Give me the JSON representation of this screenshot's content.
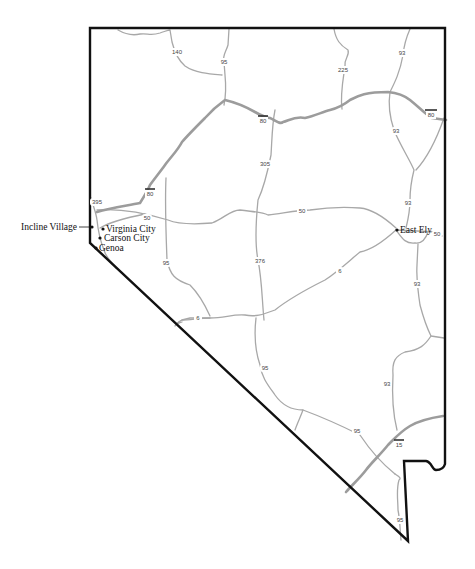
{
  "map": {
    "region": "Nevada",
    "cities": [
      {
        "id": "incline-village",
        "name": "Incline Village",
        "label_side": "left"
      },
      {
        "id": "virginia-city",
        "name": "Virginia City",
        "label_side": "right"
      },
      {
        "id": "carson-city",
        "name": "Carson City",
        "label_side": "right"
      },
      {
        "id": "genoa",
        "name": "Genoa",
        "label_side": "right"
      },
      {
        "id": "east-ely",
        "name": "East Ely",
        "label_side": "right"
      }
    ],
    "route_shields": [
      {
        "id": "140",
        "label": "140",
        "type": "state"
      },
      {
        "id": "95-north",
        "label": "95",
        "type": "us"
      },
      {
        "id": "225",
        "label": "225",
        "type": "state"
      },
      {
        "id": "93-north",
        "label": "93",
        "type": "us"
      },
      {
        "id": "80-central",
        "label": "80",
        "type": "interstate"
      },
      {
        "id": "80-east",
        "label": "80",
        "type": "interstate"
      },
      {
        "id": "80-west",
        "label": "80",
        "type": "interstate"
      },
      {
        "id": "93-wells",
        "label": "93",
        "type": "us"
      },
      {
        "id": "305",
        "label": "305",
        "type": "state"
      },
      {
        "id": "395",
        "label": "395",
        "type": "us"
      },
      {
        "id": "50-west",
        "label": "50",
        "type": "us"
      },
      {
        "id": "50-central",
        "label": "50",
        "type": "us"
      },
      {
        "id": "93-ely-north",
        "label": "93",
        "type": "us"
      },
      {
        "id": "50-east",
        "label": "50",
        "type": "us"
      },
      {
        "id": "95-fallon",
        "label": "95",
        "type": "us"
      },
      {
        "id": "376",
        "label": "376",
        "type": "state"
      },
      {
        "id": "6-east",
        "label": "6",
        "type": "us"
      },
      {
        "id": "6-west",
        "label": "6",
        "type": "us"
      },
      {
        "id": "93-ely-south",
        "label": "93",
        "type": "us"
      },
      {
        "id": "95-tonopah",
        "label": "95",
        "type": "us"
      },
      {
        "id": "93-south",
        "label": "93",
        "type": "us"
      },
      {
        "id": "95-beatty",
        "label": "95",
        "type": "us"
      },
      {
        "id": "15",
        "label": "15",
        "type": "interstate"
      },
      {
        "id": "95-south",
        "label": "95",
        "type": "us"
      }
    ]
  }
}
